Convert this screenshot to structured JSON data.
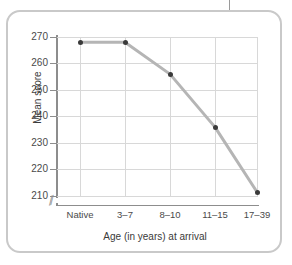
{
  "figure": {
    "frame_color": "#c9c9c9",
    "background": "#ffffff"
  },
  "chart_data": {
    "type": "line",
    "title": "",
    "xlabel": "Age (in years) at arrival",
    "ylabel": "Mean score",
    "categories": [
      "Native",
      "3–7",
      "8–10",
      "11–15",
      "17–39"
    ],
    "values": [
      268,
      268,
      256,
      236,
      211.5
    ],
    "series": [
      {
        "name": "Mean score",
        "values": [
          268,
          268,
          256,
          236,
          211.5
        ]
      }
    ],
    "ylim": [
      210,
      270
    ],
    "yticks": [
      270,
      260,
      250,
      240,
      230,
      220,
      210
    ],
    "ytick_labels": [
      "270",
      "260",
      "250",
      "240",
      "230",
      "220",
      "210"
    ],
    "xtick_labels": [
      "Native",
      "3–7",
      "8–10",
      "11–15",
      "17–39"
    ],
    "grid": true,
    "legend": "none",
    "axis_break": "⁄⁄",
    "axis_break_present": true,
    "line_color": "#b5b5b5",
    "marker_color": "#3a3a3a",
    "grid_color": "#d8d8d8",
    "axis_color": "#8d8d8d"
  }
}
